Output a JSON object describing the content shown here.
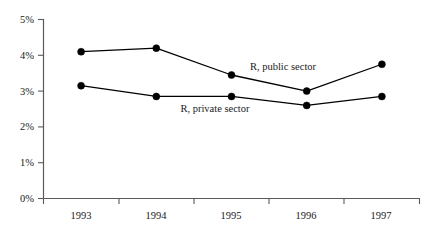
{
  "chart_data": {
    "type": "line",
    "title": "",
    "subtitle": "",
    "xlabel": "",
    "ylabel": "",
    "categories": [
      "1993",
      "1994",
      "1995",
      "1996",
      "1997"
    ],
    "x": [
      1993,
      1994,
      1995,
      1996,
      1997
    ],
    "series": [
      {
        "name": "R, public sector",
        "values": [
          4.1,
          4.2,
          3.45,
          3.0,
          3.75
        ]
      },
      {
        "name": "R, private sector",
        "values": [
          3.15,
          2.85,
          2.85,
          2.6,
          2.85
        ]
      }
    ],
    "ylim": [
      0,
      5
    ],
    "ytick_values": [
      0,
      1,
      2,
      3,
      4,
      5
    ],
    "ytick_labels": [
      "0%",
      "1%",
      "2%",
      "3%",
      "4%",
      "5%"
    ],
    "xtick_labels": [
      "1993",
      "1994",
      "1995",
      "1996",
      "1997"
    ],
    "grid": false,
    "legend": "inline-annotations",
    "annotations": [
      {
        "text": "R, public sector",
        "series": "R, public sector",
        "x_frac": 0.71,
        "y_value": 3.35
      },
      {
        "text": "R, private sector",
        "series": "R, private sector",
        "x_frac": 0.46,
        "y_value": 2.42
      }
    ],
    "colors": {
      "line": "#000000",
      "marker": "#000000",
      "axis": "#5a5a5a",
      "background": "#ffffff",
      "text": "#1a1a1a"
    }
  }
}
